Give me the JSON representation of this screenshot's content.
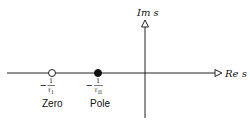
{
  "diagram": {
    "type": "s-plane pole-zero plot",
    "axes": {
      "real_label": "Re s",
      "imag_label": "Im s"
    },
    "points": [
      {
        "kind": "zero",
        "marker": "hollow-circle",
        "value_sign": "−",
        "value_num": "1",
        "value_den": "τ",
        "value_den_sub": "I",
        "name": "Zero"
      },
      {
        "kind": "pole",
        "marker": "filled-circle",
        "value_sign": "−",
        "value_num": "1",
        "value_den": "τ",
        "value_den_sub": "II",
        "name": "Pole"
      }
    ],
    "colors": {
      "stroke": "#222222",
      "background": "#ffffff"
    }
  }
}
